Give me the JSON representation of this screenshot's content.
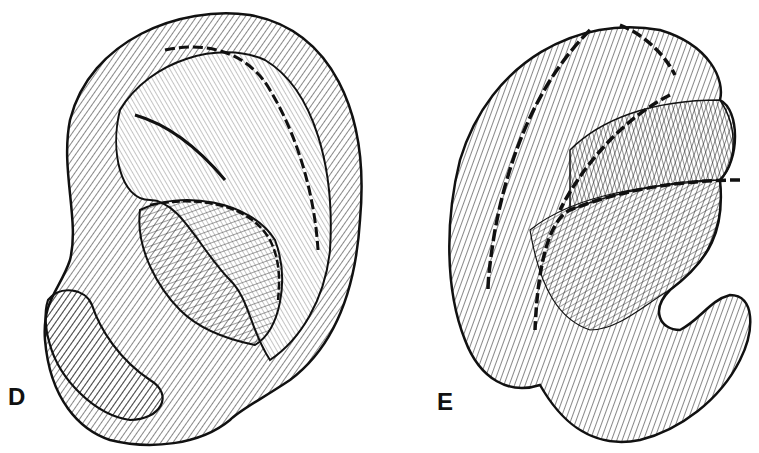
{
  "figure": {
    "panels": [
      {
        "id": "D",
        "label": "D",
        "subject": "ear-illustration-lateral-view"
      },
      {
        "id": "E",
        "label": "E",
        "subject": "ear-illustration-posterior-view"
      }
    ],
    "colors": {
      "ink": "#111111",
      "background": "#ffffff"
    }
  }
}
